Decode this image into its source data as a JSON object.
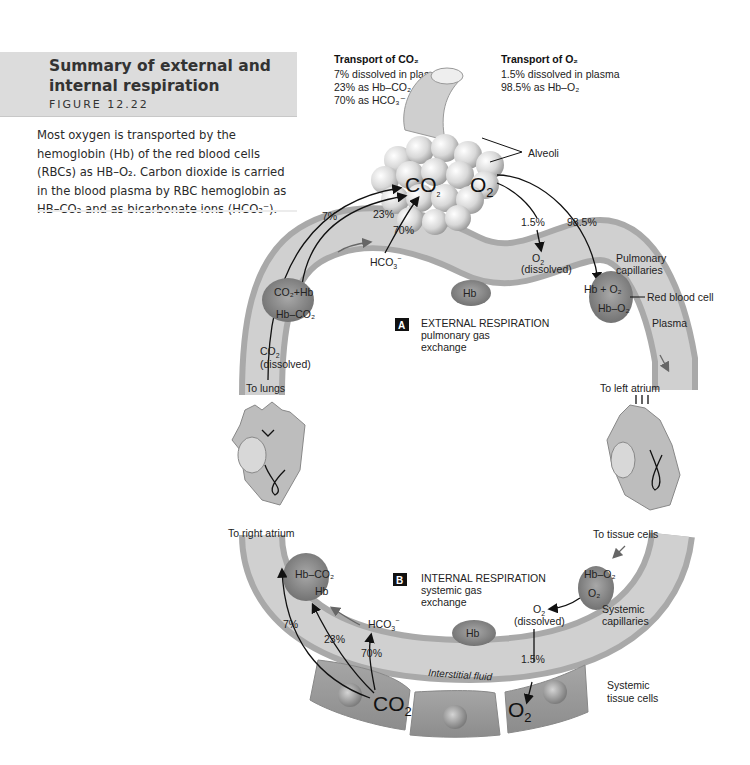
{
  "caption": {
    "title": "Summary of external and internal respiration",
    "figure": "Figure 12.22",
    "body": "Most oxygen is transported by the hemoglobin (Hb) of the red blood cells (RBCs) as HB–O₂. Carbon dioxide is carried in the blood plasma by RBC hemoglobin as HB–CO₂ and as bicarbonate ions (HCO₃⁻)."
  },
  "legend": {
    "co2": {
      "title": "Transport of CO₂",
      "lines": [
        "7% dissolved in plasma",
        "23% as Hb–CO₂",
        "70% as HCO₃⁻"
      ]
    },
    "o2": {
      "title": "Transport of O₂",
      "lines": [
        "1.5% dissolved in plasma",
        "98.5% as Hb–O₂"
      ]
    }
  },
  "external": {
    "badge": "A",
    "title": "EXTERNAL RESPIRATION",
    "subtitle_1": "pulmonary gas",
    "subtitle_2": "exchange",
    "alveoli_label": "Alveoli",
    "co2_big": "CO",
    "o2_big": "O",
    "pct_7": "7%",
    "pct_23": "23%",
    "pct_70": "70%",
    "pct_1_5": "1.5%",
    "pct_98_5": "98.5%",
    "hco3": "HCO",
    "o2_dissolved_1": "O",
    "o2_dissolved_2": "(dissolved)",
    "rbc_left_top": "CO₂+Hb",
    "rbc_left_bottom": "Hb–CO₂",
    "rbc_right_top": "Hb + O₂",
    "rbc_right_bottom": "Hb–O₂",
    "hb": "Hb",
    "co2_dissolved_1": "CO",
    "co2_dissolved_2": "(dissolved)",
    "pulmonary_1": "Pulmonary",
    "pulmonary_2": "capillaries",
    "red_blood_cell": "Red blood cell",
    "plasma": "Plasma"
  },
  "heart": {
    "to_lungs": "To lungs",
    "to_left_atrium": "To left atrium",
    "to_right_atrium": "To right atrium",
    "to_tissue_cells": "To tissue cells"
  },
  "internal": {
    "badge": "B",
    "title": "INTERNAL RESPIRATION",
    "subtitle_1": "systemic gas",
    "subtitle_2": "exchange",
    "rbc_left_top": "Hb–CO₂",
    "rbc_left_bottom": "Hb",
    "rbc_right_top": "Hb–O₂",
    "rbc_right_bottom": "O₂",
    "hco3": "HCO",
    "hb": "Hb",
    "o2_dissolved_1": "O",
    "o2_dissolved_2": "(dissolved)",
    "pct_7": "7%",
    "pct_23": "23%",
    "pct_70": "70%",
    "pct_1_5": "1.5%",
    "interstitial": "Interstitial fluid",
    "co2_big": "CO",
    "o2_big": "O",
    "systemic_cap_1": "Systemic",
    "systemic_cap_2": "capillaries",
    "systemic_tissue_1": "Systemic",
    "systemic_tissue_2": "tissue cells"
  },
  "colors": {
    "caption_bg": "#dcdcdc",
    "vessel": "#c9c9c9",
    "rbc": "#8a8a8a",
    "badge": "#111111"
  }
}
